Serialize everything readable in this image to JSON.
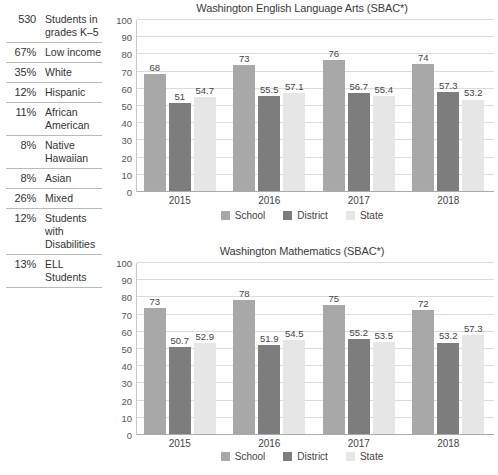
{
  "sidebar": {
    "rows": [
      {
        "value": "530",
        "label": "Students in grades K–5"
      },
      {
        "value": "67%",
        "label": "Low income"
      },
      {
        "value": "35%",
        "label": "White"
      },
      {
        "value": "12%",
        "label": "Hispanic"
      },
      {
        "value": "11%",
        "label": "African American"
      },
      {
        "value": "8%",
        "label": "Native Hawaiian"
      },
      {
        "value": "8%",
        "label": "Asian"
      },
      {
        "value": "26%",
        "label": "Mixed"
      },
      {
        "value": "12%",
        "label": "Students with Disabilities"
      },
      {
        "value": "13%",
        "label": "ELL Students"
      }
    ]
  },
  "colors": {
    "school": "#a8a8a8",
    "district": "#7d7d7d",
    "state": "#e6e6e6",
    "grid": "#dcdcdc",
    "axis": "#aaaaaa",
    "text": "#3b3b3b"
  },
  "chart_data": [
    {
      "type": "bar",
      "title": "Washington English Language Arts (SBAC*)",
      "xlabel": "",
      "ylabel": "",
      "ylim": [
        0,
        100
      ],
      "yticks": [
        0,
        10,
        20,
        30,
        40,
        50,
        60,
        70,
        80,
        90,
        100
      ],
      "grid": true,
      "legend_position": "bottom",
      "categories": [
        "2015",
        "2016",
        "2017",
        "2018"
      ],
      "series": [
        {
          "name": "School",
          "values": [
            68,
            73,
            76,
            74
          ],
          "labels": [
            "68",
            "73",
            "76",
            "74"
          ]
        },
        {
          "name": "District",
          "values": [
            51,
            55.5,
            56.7,
            57.3
          ],
          "labels": [
            "51",
            "55.5",
            "56.7",
            "57.3"
          ]
        },
        {
          "name": "State",
          "values": [
            54.7,
            57.1,
            55.4,
            53.2
          ],
          "labels": [
            "54.7",
            "57.1",
            "55.4",
            "53.2"
          ]
        }
      ]
    },
    {
      "type": "bar",
      "title": "Washington Mathematics (SBAC*)",
      "xlabel": "",
      "ylabel": "",
      "ylim": [
        0,
        100
      ],
      "yticks": [
        0,
        10,
        20,
        30,
        40,
        50,
        60,
        70,
        80,
        90,
        100
      ],
      "grid": true,
      "legend_position": "bottom",
      "categories": [
        "2015",
        "2016",
        "2017",
        "2018"
      ],
      "series": [
        {
          "name": "School",
          "values": [
            73,
            78,
            75,
            72
          ],
          "labels": [
            "73",
            "78",
            "75",
            "72"
          ]
        },
        {
          "name": "District",
          "values": [
            50.7,
            51.9,
            55.2,
            53.2
          ],
          "labels": [
            "50.7",
            "51.9",
            "55.2",
            "53.2"
          ]
        },
        {
          "name": "State",
          "values": [
            52.9,
            54.5,
            53.5,
            57.3
          ],
          "labels": [
            "52.9",
            "54.5",
            "53.5",
            "57.3"
          ]
        }
      ]
    }
  ]
}
